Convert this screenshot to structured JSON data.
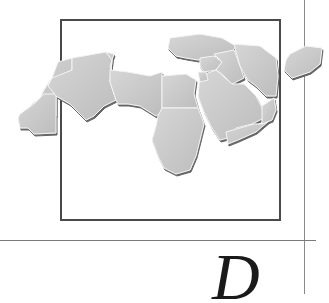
{
  "page": {
    "illustration": "map-of-arab-world",
    "region_label": "",
    "drop_cap": "D"
  },
  "colors": {
    "land": "#c9c9c9",
    "border": "#f2f2f2",
    "shadow": "#6e6e6e",
    "frame": "#4a4a4a",
    "rule": "#7a7a7a"
  }
}
